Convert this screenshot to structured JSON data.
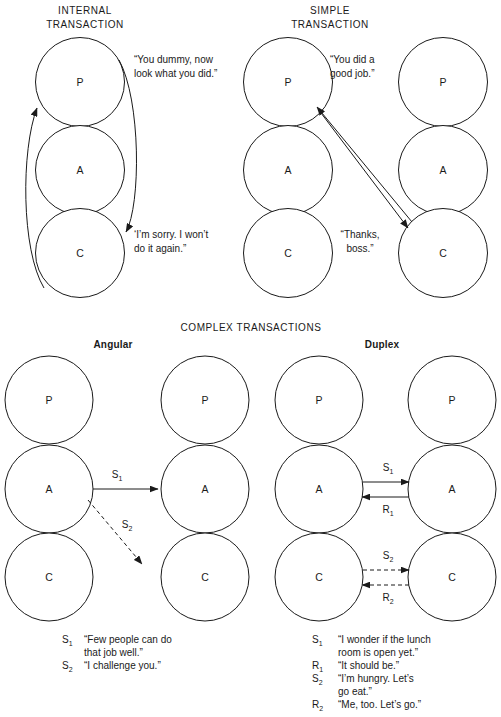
{
  "page": {
    "background": "#ffffff",
    "ink": "#1a1a1a"
  },
  "sections": {
    "internal": {
      "title_line1": "INTERNAL",
      "title_line2": "TRANSACTION",
      "states": {
        "parent": "P",
        "adult": "A",
        "child": "C"
      },
      "quotes": {
        "from_parent_line1": "“You dummy, now",
        "from_parent_line2": "look what you did.”",
        "from_child_line1": "‘I’m sorry. I won’t",
        "from_child_line2": "do it again.”"
      }
    },
    "simple": {
      "title_line1": "SIMPLE",
      "title_line2": "TRANSACTION",
      "states": {
        "parent": "P",
        "adult": "A",
        "child": "C"
      },
      "quotes": {
        "stimulus_line1": "“You did a",
        "stimulus_line2": "good job.”",
        "response_line1": "“Thanks,",
        "response_line2": "boss.”"
      }
    },
    "complex": {
      "title": "COMPLEX TRANSACTIONS",
      "angular": {
        "subtitle": "Angular",
        "states": {
          "parent": "P",
          "adult": "A",
          "child": "C"
        },
        "arrows": [
          {
            "key": "S",
            "sub": "1",
            "style": "solid"
          },
          {
            "key": "S",
            "sub": "2",
            "style": "dashed"
          }
        ],
        "legend": [
          {
            "key": "S",
            "sub": "1",
            "line1": "“Few people can do",
            "line2": "that job well.”"
          },
          {
            "key": "S",
            "sub": "2",
            "line1": "“I challenge you.”",
            "line2": ""
          }
        ]
      },
      "duplex": {
        "subtitle": "Duplex",
        "states": {
          "parent": "P",
          "adult": "A",
          "child": "C"
        },
        "arrows": [
          {
            "key": "S",
            "sub": "1",
            "style": "solid"
          },
          {
            "key": "R",
            "sub": "1",
            "style": "solid"
          },
          {
            "key": "S",
            "sub": "2",
            "style": "dashed"
          },
          {
            "key": "R",
            "sub": "2",
            "style": "dashed"
          }
        ],
        "legend": [
          {
            "key": "S",
            "sub": "1",
            "line1": "“I wonder if the lunch",
            "line2": "room is open yet.”"
          },
          {
            "key": "R",
            "sub": "1",
            "line1": "“It should be.”",
            "line2": ""
          },
          {
            "key": "S",
            "sub": "2",
            "line1": "“I’m hungry. Let’s",
            "line2": "go eat.”"
          },
          {
            "key": "R",
            "sub": "2",
            "line1": "“Me, too. Let’s go.”",
            "line2": ""
          }
        ]
      }
    }
  }
}
